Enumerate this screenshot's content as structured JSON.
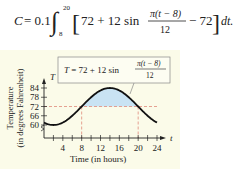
{
  "formula": {
    "lhs": "C = 0.1",
    "integral_lower": "8",
    "integral_upper": "20",
    "term1": "72 + 12 sin",
    "frac_num": "π(t − 8)",
    "frac_den": "12",
    "term2": "− 72",
    "dt": "dt."
  },
  "chart_data": {
    "type": "line",
    "title": "",
    "equation_label": {
      "prefix": "T = 72 + 12 sin",
      "frac_num": "π(t − 8)",
      "frac_den": "12"
    },
    "xlabel": "Time (in hours)",
    "ylabel_line1": "Temperature",
    "ylabel_line2": "(in degrees Fahrenheit)",
    "x_axis_var": "t",
    "y_axis_var": "T",
    "x_ticks": [
      4,
      8,
      12,
      16,
      20,
      24
    ],
    "y_ticks": [
      60,
      66,
      72,
      78,
      84
    ],
    "xlim": [
      0,
      24
    ],
    "ylim": [
      57,
      87
    ],
    "reference_line_y": 72,
    "shaded_interval": [
      8,
      20
    ],
    "shade_color": "#c9e3f3",
    "dash_color": "#e08a7a",
    "curve_color": "#111111",
    "series": [
      {
        "name": "T = 72 + 12 sin(π(t−8)/12)",
        "x": [
          0,
          2,
          4,
          6,
          8,
          10,
          12,
          14,
          16,
          18,
          20,
          22,
          24
        ],
        "values": [
          61.6,
          60.0,
          61.6,
          66.0,
          72.0,
          78.0,
          82.4,
          84.0,
          82.4,
          78.0,
          72.0,
          66.0,
          61.6
        ]
      }
    ]
  }
}
